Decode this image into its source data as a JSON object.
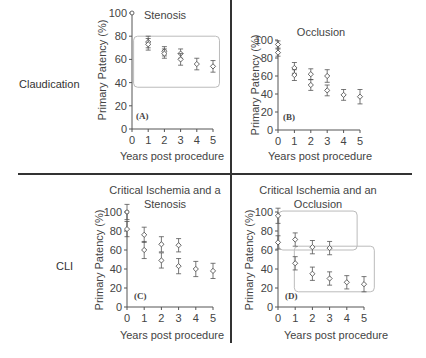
{
  "figure": {
    "row_labels": [
      "Claudication",
      "CLI"
    ],
    "colors": {
      "axis": "#555555",
      "marker": "#555555",
      "highlight_box": "#bbbbbb",
      "divider": "#333333"
    }
  },
  "chart_data": [
    {
      "type": "scatter",
      "panel": "(A)",
      "title": "Stenosis",
      "row": "Claudication",
      "xlabel": "Years post procedure",
      "ylabel": "Primary Patency (%)",
      "x_ticks": [
        0,
        1,
        2,
        3,
        4,
        5
      ],
      "y_ticks": [
        0,
        20,
        40,
        60,
        80,
        100
      ],
      "xlim": [
        0,
        5
      ],
      "ylim": [
        0,
        100
      ],
      "series": [
        {
          "name": "series1",
          "points": [
            {
              "x": 0,
              "y": 100,
              "err": 0
            },
            {
              "x": 1,
              "y": 75,
              "err": 5
            },
            {
              "x": 2,
              "y": 67,
              "err": 4
            },
            {
              "x": 3,
              "y": 65,
              "err": 4
            },
            {
              "x": 4,
              "y": 56,
              "err": 5
            },
            {
              "x": 5,
              "y": 54,
              "err": 5
            }
          ]
        },
        {
          "name": "series2",
          "points": [
            {
              "x": 1,
              "y": 73,
              "err": 5
            },
            {
              "x": 2,
              "y": 65,
              "err": 4
            },
            {
              "x": 3,
              "y": 60,
              "err": 5
            }
          ]
        }
      ],
      "highlight_boxes": [
        {
          "x0": 0.1,
          "x1": 5.4,
          "y0": 36,
          "y1": 80
        }
      ]
    },
    {
      "type": "scatter",
      "panel": "(B)",
      "title": "Occlusion",
      "row": "Claudication",
      "xlabel": "Years post procedure",
      "ylabel": "Primary Patency (%)",
      "x_ticks": [
        0,
        1,
        2,
        3,
        4,
        5
      ],
      "y_ticks": [
        0,
        20,
        40,
        60,
        80,
        100
      ],
      "xlim": [
        0,
        5
      ],
      "ylim": [
        0,
        100
      ],
      "series": [
        {
          "name": "series1",
          "points": [
            {
              "x": 0,
              "y": 95,
              "err": 4
            },
            {
              "x": 1,
              "y": 69,
              "err": 6
            },
            {
              "x": 2,
              "y": 62,
              "err": 6
            },
            {
              "x": 3,
              "y": 60,
              "err": 7
            },
            {
              "x": 4,
              "y": 39,
              "err": 6
            },
            {
              "x": 5,
              "y": 37,
              "err": 8
            }
          ]
        },
        {
          "name": "series2",
          "points": [
            {
              "x": 0,
              "y": 86,
              "err": 4
            },
            {
              "x": 1,
              "y": 61,
              "err": 6
            },
            {
              "x": 2,
              "y": 50,
              "err": 6
            },
            {
              "x": 3,
              "y": 44,
              "err": 6
            }
          ]
        }
      ],
      "highlight_boxes": []
    },
    {
      "type": "scatter",
      "panel": "(C)",
      "title": "Critical Ischemia and a Stenosis",
      "row": "CLI",
      "xlabel": "Years post procedure",
      "ylabel": "Primary Patency (%)",
      "x_ticks": [
        0,
        1,
        2,
        3,
        4,
        5
      ],
      "y_ticks": [
        0,
        20,
        40,
        60,
        80,
        100
      ],
      "xlim": [
        0,
        5
      ],
      "ylim": [
        0,
        100
      ],
      "series": [
        {
          "name": "series1",
          "points": [
            {
              "x": 0,
              "y": 100,
              "err": 8
            },
            {
              "x": 1,
              "y": 76,
              "err": 8
            },
            {
              "x": 2,
              "y": 66,
              "err": 8
            },
            {
              "x": 3,
              "y": 65,
              "err": 7
            },
            {
              "x": 4,
              "y": 40,
              "err": 8
            },
            {
              "x": 5,
              "y": 38,
              "err": 8
            }
          ]
        },
        {
          "name": "series2",
          "points": [
            {
              "x": 0,
              "y": 82,
              "err": 8
            },
            {
              "x": 1,
              "y": 60,
              "err": 9
            },
            {
              "x": 2,
              "y": 49,
              "err": 8
            },
            {
              "x": 3,
              "y": 43,
              "err": 8
            }
          ]
        }
      ],
      "highlight_boxes": []
    },
    {
      "type": "scatter",
      "panel": "(D)",
      "title": "Critical Ischemia and an Occlusion",
      "row": "CLI",
      "xlabel": "Years post procedure",
      "ylabel": "Primary Patency (%)",
      "x_ticks": [
        0,
        1,
        2,
        3,
        4,
        5
      ],
      "y_ticks": [
        0,
        20,
        40,
        60,
        80,
        100
      ],
      "xlim": [
        0,
        5
      ],
      "ylim": [
        0,
        100
      ],
      "series": [
        {
          "name": "series1",
          "points": [
            {
              "x": 0,
              "y": 96,
              "err": 8
            },
            {
              "x": 1,
              "y": 71,
              "err": 7
            },
            {
              "x": 2,
              "y": 63,
              "err": 7
            },
            {
              "x": 3,
              "y": 62,
              "err": 7
            },
            {
              "x": 4,
              "y": 26,
              "err": 7
            },
            {
              "x": 5,
              "y": 24,
              "err": 8
            }
          ]
        },
        {
          "name": "series2",
          "points": [
            {
              "x": 0,
              "y": 68,
              "err": 7
            },
            {
              "x": 1,
              "y": 46,
              "err": 7
            },
            {
              "x": 2,
              "y": 35,
              "err": 7
            },
            {
              "x": 3,
              "y": 30,
              "err": 7
            }
          ]
        }
      ],
      "highlight_boxes": [
        {
          "x0": 0.05,
          "x1": 4.6,
          "y0": 60,
          "y1": 101
        },
        {
          "x0": 0.95,
          "x1": 5.6,
          "y0": 16,
          "y1": 64
        }
      ]
    }
  ]
}
